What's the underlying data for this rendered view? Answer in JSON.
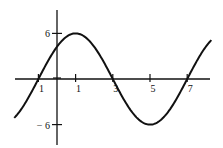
{
  "chart_data": {
    "type": "line",
    "title": "",
    "xlabel": "",
    "ylabel": "",
    "function": "y = 6 sin(pi (x + 1) / 4)",
    "x_ticks": [
      -1,
      1,
      3,
      5,
      7
    ],
    "x_tick_labels": [
      "-1",
      "1",
      "3",
      "5",
      "7"
    ],
    "y_ticks": [
      6,
      -6
    ],
    "y_tick_labels": [
      "6",
      "-6"
    ],
    "xlim": [
      -2,
      8
    ],
    "ylim": [
      -8,
      8
    ],
    "grid": false,
    "series": [
      {
        "name": "curve",
        "x": [
          -2,
          -1,
          0,
          1,
          2,
          3,
          4,
          5,
          6,
          7,
          8
        ],
        "values": [
          -4.24,
          0,
          4.24,
          6,
          4.24,
          0,
          -4.24,
          -6,
          -4.24,
          0,
          4.24
        ]
      }
    ],
    "key_points": {
      "maximum": [
        1,
        6
      ],
      "minimum": [
        5,
        -6
      ],
      "zeros": [
        -1,
        3,
        7
      ]
    }
  },
  "colors": {
    "line": "#111111",
    "background": "#ffffff"
  }
}
